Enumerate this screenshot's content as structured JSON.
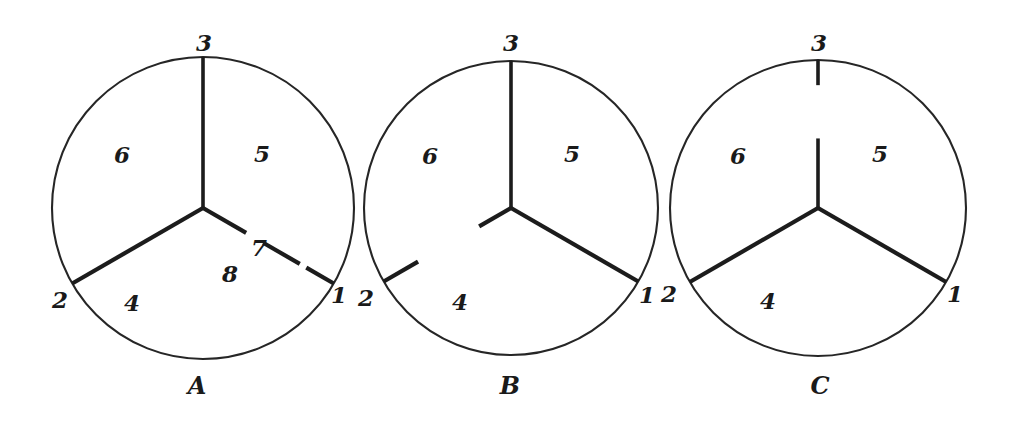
{
  "figure": {
    "background_color": "#ffffff",
    "stroke_color": "#1c1c1c",
    "outline_color": "#262626",
    "panels": [
      {
        "id": "A",
        "caption": "A",
        "caption_x": 197,
        "caption_y": 386,
        "center_x": 203,
        "center_y": 208,
        "radius": 151,
        "region_labels": [
          {
            "text": "6",
            "x": 122,
            "y": 154
          },
          {
            "text": "5",
            "x": 262,
            "y": 153
          },
          {
            "text": "4",
            "x": 132,
            "y": 302
          }
        ],
        "boundary_labels": [
          {
            "text": "3",
            "x": 204,
            "y": 42
          },
          {
            "text": "2",
            "x": 60,
            "y": 299
          },
          {
            "text": "1",
            "x": 339,
            "y": 294
          }
        ],
        "radius_labels": [
          {
            "text": "7",
            "x": 259,
            "y": 247
          },
          {
            "text": "8",
            "x": 230,
            "y": 273
          }
        ],
        "spokes": [
          {
            "angle_deg": 90,
            "segments": [
              [
                0.0,
                1.0
              ]
            ]
          },
          {
            "angle_deg": 210,
            "segments": [
              [
                0.0,
                1.0
              ]
            ]
          },
          {
            "angle_deg": 330,
            "segments": [
              [
                0.0,
                0.33
              ],
              [
                0.46,
                0.74
              ],
              [
                0.79,
                1.0
              ]
            ]
          }
        ]
      },
      {
        "id": "B",
        "caption": "B",
        "caption_x": 510,
        "caption_y": 386,
        "center_x": 511,
        "center_y": 208,
        "radius": 147,
        "region_labels": [
          {
            "text": "6",
            "x": 430,
            "y": 155
          },
          {
            "text": "5",
            "x": 572,
            "y": 153
          },
          {
            "text": "4",
            "x": 460,
            "y": 301
          }
        ],
        "boundary_labels": [
          {
            "text": "3",
            "x": 511,
            "y": 42
          },
          {
            "text": "2",
            "x": 366,
            "y": 297
          },
          {
            "text": "1",
            "x": 647,
            "y": 294
          }
        ],
        "radius_labels": [],
        "spokes": [
          {
            "angle_deg": 90,
            "segments": [
              [
                0.0,
                1.0
              ]
            ]
          },
          {
            "angle_deg": 210,
            "segments": [
              [
                0.0,
                0.25
              ],
              [
                0.73,
                1.0
              ]
            ]
          },
          {
            "angle_deg": 330,
            "segments": [
              [
                0.0,
                1.0
              ]
            ]
          }
        ]
      },
      {
        "id": "C",
        "caption": "C",
        "caption_x": 820,
        "caption_y": 386,
        "center_x": 818,
        "center_y": 208,
        "radius": 148,
        "region_labels": [
          {
            "text": "6",
            "x": 738,
            "y": 155
          },
          {
            "text": "5",
            "x": 880,
            "y": 153
          },
          {
            "text": "4",
            "x": 768,
            "y": 300
          },
          {
            "text": "3",
            "x": 819,
            "y": 42
          }
        ],
        "boundary_labels": [
          {
            "text": "2",
            "x": 669,
            "y": 293
          },
          {
            "text": "1",
            "x": 955,
            "y": 293
          }
        ],
        "radius_labels": [],
        "spokes": [
          {
            "angle_deg": 90,
            "segments": [
              [
                0.0,
                0.47
              ],
              [
                0.83,
                1.0
              ]
            ]
          },
          {
            "angle_deg": 210,
            "segments": [
              [
                0.0,
                1.0
              ]
            ]
          },
          {
            "angle_deg": 330,
            "segments": [
              [
                0.0,
                1.0
              ]
            ]
          }
        ]
      }
    ]
  }
}
